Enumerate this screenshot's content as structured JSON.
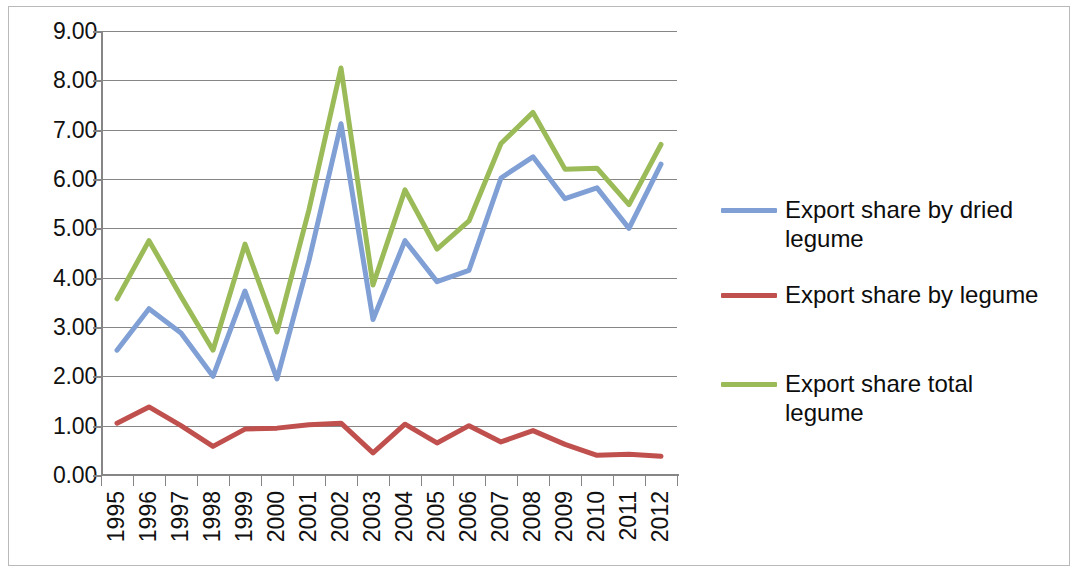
{
  "chart_data": {
    "type": "line",
    "title": "",
    "xlabel": "",
    "ylabel": "",
    "grid": true,
    "legend_position": "right",
    "ylim": [
      0,
      9
    ],
    "ytick_step": 1,
    "ytick_labels": [
      "9.00",
      "8.00",
      "7.00",
      "6.00",
      "5.00",
      "4.00",
      "3.00",
      "2.00",
      "1.00",
      "0.00"
    ],
    "categories": [
      "1995",
      "1996",
      "1997",
      "1998",
      "1999",
      "2000",
      "2001",
      "2002",
      "2003",
      "2004",
      "2005",
      "2006",
      "2007",
      "2008",
      "2009",
      "2010",
      "2011",
      "2012"
    ],
    "series": [
      {
        "name": "Export share by dried legume",
        "color": "#7f9fd5",
        "values": [
          2.53,
          3.37,
          2.88,
          2.0,
          3.73,
          1.95,
          4.35,
          7.12,
          3.15,
          4.75,
          3.92,
          4.15,
          6.02,
          6.45,
          5.6,
          5.82,
          5.0,
          6.3
        ]
      },
      {
        "name": "Export  share by legume",
        "color": "#c0504d",
        "values": [
          1.05,
          1.38,
          1.0,
          0.58,
          0.93,
          0.95,
          1.02,
          1.05,
          0.45,
          1.03,
          0.65,
          1.0,
          0.67,
          0.9,
          0.62,
          0.4,
          0.42,
          0.38
        ]
      },
      {
        "name": "Export share total legume",
        "color": "#9bbb59",
        "values": [
          3.57,
          4.75,
          3.62,
          2.53,
          4.68,
          2.9,
          5.38,
          8.25,
          3.85,
          5.78,
          4.58,
          5.15,
          6.72,
          7.35,
          6.2,
          6.22,
          5.48,
          6.7
        ]
      }
    ]
  },
  "legend": {
    "items": [
      {
        "label": "Export share by dried legume",
        "color": "#7f9fd5"
      },
      {
        "label": "Export  share by legume",
        "color": "#c0504d"
      },
      {
        "label": "Export share total legume",
        "color": "#9bbb59"
      }
    ]
  }
}
